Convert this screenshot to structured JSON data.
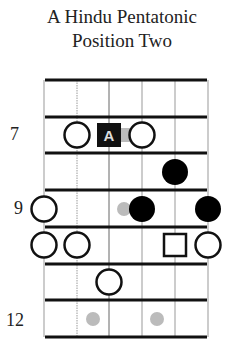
{
  "title": {
    "line1": "A Hindu Pentatonic",
    "line2": "Position Two"
  },
  "fret_labels": [
    {
      "text": "7",
      "fret_space": 2
    },
    {
      "text": "9",
      "fret_space": 4
    },
    {
      "text": "12",
      "fret_space": 7
    }
  ],
  "diagram": {
    "strings": 6,
    "fret_spaces": 7,
    "first_fret": 6,
    "root_label": "A",
    "notes": [
      {
        "fret": 7,
        "string": 2,
        "type": "hollow-circle"
      },
      {
        "fret": 7,
        "string": 3,
        "type": "root-square",
        "label": "A"
      },
      {
        "fret": 7,
        "string": 4,
        "type": "hollow-circle"
      },
      {
        "fret": 8,
        "string": 5,
        "type": "filled-circle"
      },
      {
        "fret": 9,
        "string": 1,
        "type": "hollow-circle"
      },
      {
        "fret": 9,
        "string": 4,
        "type": "filled-circle"
      },
      {
        "fret": 9,
        "string": 6,
        "type": "filled-circle"
      },
      {
        "fret": 10,
        "string": 1,
        "type": "hollow-circle"
      },
      {
        "fret": 10,
        "string": 2,
        "type": "hollow-circle"
      },
      {
        "fret": 10,
        "string": 5,
        "type": "hollow-square"
      },
      {
        "fret": 10,
        "string": 6,
        "type": "hollow-circle"
      },
      {
        "fret": 11,
        "string": 3,
        "type": "hollow-circle"
      }
    ],
    "inlays": [
      {
        "fret": 7,
        "type": "grey-tab"
      },
      {
        "fret": 9,
        "type": "grey-dot"
      },
      {
        "fret": 12,
        "type": "grey-dot",
        "count": 2
      }
    ]
  }
}
